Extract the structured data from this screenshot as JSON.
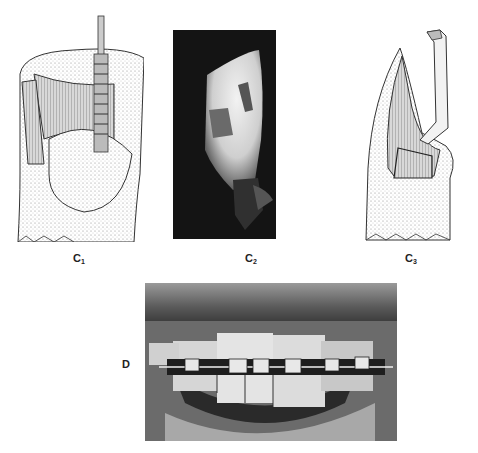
{
  "figure": {
    "panels": [
      {
        "id": "c1",
        "label_letter": "C",
        "label_sub": "1",
        "kind": "illustration",
        "subject": "tooth with bur preparing cavity"
      },
      {
        "id": "c2",
        "label_letter": "C",
        "label_sub": "2",
        "kind": "photograph",
        "subject": "tooth cavity preparation on dark background"
      },
      {
        "id": "c3",
        "label_letter": "C",
        "label_sub": "3",
        "kind": "illustration",
        "subject": "tooth with instrument in cavity"
      },
      {
        "id": "d",
        "label_letter": "D",
        "label_sub": "",
        "kind": "photograph",
        "subject": "anterior teeth with orthodontic brackets and archwire"
      }
    ]
  }
}
